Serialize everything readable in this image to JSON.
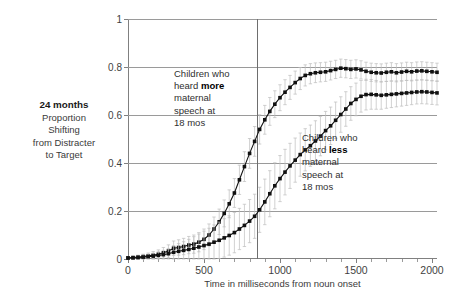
{
  "y_axis_caption": {
    "strong": "24 months",
    "lines": [
      "Proportion",
      "Shifting",
      "from Distracter",
      "to Target"
    ]
  },
  "annotations": {
    "more": {
      "pre": "Children who\nheard ",
      "strong": "more",
      "post": "\nmaternal\nspeech at\n18 mos"
    },
    "less": {
      "pre": "Children who\nheard ",
      "strong": "less",
      "post": "\nmaternal\nspeech at\n18 mos"
    }
  },
  "colors": {
    "series": "#111111",
    "errorbar": "#bdbdbd",
    "gridline": "#9a9a9a",
    "axis": "#808080",
    "marker_line": "#6e6e6e",
    "background": "#ffffff"
  },
  "chart_data": {
    "type": "line",
    "title": "",
    "xlabel": "Time in milliseconds from noun onset",
    "ylabel": "24 months Proportion Shifting from Distracter to Target",
    "xlim": [
      0,
      2033
    ],
    "ylim": [
      0,
      1
    ],
    "xticks": [
      0,
      500,
      1000,
      1500,
      2000
    ],
    "xtick_labels": [
      "0",
      "500",
      "1000",
      "1500",
      "2000"
    ],
    "xtick_minor_step": 100,
    "yticks": [
      0,
      0.2,
      0.4,
      0.6,
      0.8,
      1
    ],
    "ytick_labels": [
      "0",
      "0.2",
      "0.4",
      "0.6",
      "0.8",
      "1"
    ],
    "grid": "horizontal",
    "legend": "none",
    "annotation_vline_x": 850,
    "x": [
      0,
      33,
      66,
      100,
      133,
      166,
      200,
      233,
      266,
      300,
      333,
      366,
      400,
      433,
      466,
      500,
      533,
      566,
      600,
      633,
      666,
      700,
      733,
      766,
      800,
      833,
      866,
      900,
      933,
      966,
      1000,
      1033,
      1066,
      1100,
      1133,
      1166,
      1200,
      1233,
      1266,
      1300,
      1333,
      1366,
      1400,
      1433,
      1466,
      1500,
      1533,
      1566,
      1600,
      1633,
      1666,
      1700,
      1733,
      1766,
      1800,
      1833,
      1866,
      1900,
      1933,
      1966,
      2000,
      2033
    ],
    "series": [
      {
        "name": "Children who heard more maternal speech at 18 mos",
        "values": [
          0.005,
          0.006,
          0.008,
          0.01,
          0.013,
          0.016,
          0.02,
          0.026,
          0.033,
          0.045,
          0.048,
          0.052,
          0.058,
          0.062,
          0.07,
          0.082,
          0.1,
          0.125,
          0.155,
          0.19,
          0.23,
          0.275,
          0.33,
          0.385,
          0.44,
          0.49,
          0.54,
          0.58,
          0.615,
          0.645,
          0.672,
          0.695,
          0.715,
          0.735,
          0.752,
          0.765,
          0.772,
          0.776,
          0.778,
          0.78,
          0.785,
          0.79,
          0.795,
          0.793,
          0.79,
          0.792,
          0.788,
          0.782,
          0.778,
          0.776,
          0.775,
          0.778,
          0.78,
          0.776,
          0.779,
          0.782,
          0.78,
          0.783,
          0.784,
          0.782,
          0.78,
          0.778
        ],
        "errors": [
          0.005,
          0.006,
          0.008,
          0.01,
          0.012,
          0.015,
          0.018,
          0.022,
          0.026,
          0.03,
          0.032,
          0.034,
          0.036,
          0.038,
          0.04,
          0.043,
          0.046,
          0.05,
          0.053,
          0.056,
          0.058,
          0.06,
          0.061,
          0.062,
          0.062,
          0.062,
          0.061,
          0.06,
          0.058,
          0.056,
          0.054,
          0.052,
          0.05,
          0.048,
          0.046,
          0.044,
          0.042,
          0.041,
          0.04,
          0.04,
          0.039,
          0.038,
          0.038,
          0.038,
          0.038,
          0.038,
          0.038,
          0.038,
          0.038,
          0.038,
          0.038,
          0.038,
          0.038,
          0.038,
          0.038,
          0.038,
          0.038,
          0.038,
          0.038,
          0.038,
          0.038,
          0.038
        ]
      },
      {
        "name": "Children who heard less maternal speech at 18 mos",
        "values": [
          0.004,
          0.005,
          0.006,
          0.008,
          0.01,
          0.012,
          0.015,
          0.018,
          0.022,
          0.028,
          0.032,
          0.036,
          0.04,
          0.045,
          0.05,
          0.056,
          0.062,
          0.07,
          0.078,
          0.088,
          0.098,
          0.11,
          0.125,
          0.14,
          0.158,
          0.178,
          0.205,
          0.238,
          0.272,
          0.305,
          0.335,
          0.362,
          0.388,
          0.412,
          0.435,
          0.455,
          0.472,
          0.492,
          0.512,
          0.535,
          0.555,
          0.578,
          0.602,
          0.625,
          0.648,
          0.665,
          0.678,
          0.685,
          0.686,
          0.684,
          0.682,
          0.684,
          0.686,
          0.688,
          0.69,
          0.692,
          0.694,
          0.696,
          0.697,
          0.696,
          0.694,
          0.692
        ],
        "errors": [
          0.004,
          0.005,
          0.006,
          0.008,
          0.01,
          0.012,
          0.015,
          0.018,
          0.022,
          0.028,
          0.032,
          0.036,
          0.042,
          0.048,
          0.054,
          0.06,
          0.066,
          0.072,
          0.076,
          0.08,
          0.082,
          0.084,
          0.086,
          0.088,
          0.09,
          0.092,
          0.094,
          0.095,
          0.096,
          0.096,
          0.096,
          0.095,
          0.094,
          0.092,
          0.09,
          0.088,
          0.086,
          0.084,
          0.082,
          0.08,
          0.078,
          0.076,
          0.074,
          0.072,
          0.07,
          0.068,
          0.066,
          0.064,
          0.062,
          0.06,
          0.058,
          0.056,
          0.055,
          0.054,
          0.053,
          0.052,
          0.051,
          0.05,
          0.05,
          0.05,
          0.05,
          0.05
        ]
      }
    ]
  }
}
